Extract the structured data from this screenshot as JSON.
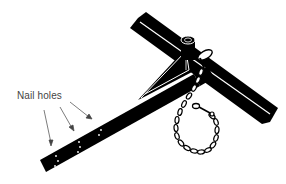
{
  "diagram": {
    "label": "Nail holes",
    "colors": {
      "background": "#ffffff",
      "ink": "#000000",
      "label_text": "#444444",
      "arrow": "#444444"
    },
    "parts": [
      "angle-iron-crossbar",
      "stake-bar-with-nail-holes",
      "triangular-brace",
      "top-post",
      "pin",
      "chain",
      "chain-hook"
    ],
    "arrows_count": 3
  }
}
